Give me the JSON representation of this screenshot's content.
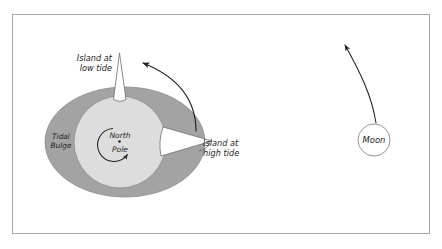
{
  "figure": {
    "frame": {
      "border_color": "#a8a8a8",
      "background_color": "#ffffff"
    }
  },
  "earth": {
    "bulge": {
      "label_line1": "Tidal",
      "label_line2": "Bulge",
      "fill_color": "#a3a3a3",
      "stroke_color": "#8a8a8a",
      "center_x": 125,
      "center_y": 142,
      "radius_x": 80,
      "radius_y": 55
    },
    "globe": {
      "fill_color": "#dddddd",
      "stroke_color": "#8a8a8a",
      "center_x": 120,
      "center_y": 142,
      "radius": 46
    },
    "pole": {
      "label_line1": "North",
      "label_line2": "Pole",
      "marker": "dot",
      "rotation_direction": "counterclockwise"
    }
  },
  "islands": [
    {
      "name": "low-tide-island",
      "label_line1": "Island at",
      "label_line2": "low tide",
      "fill_color": "#ffffff",
      "stroke_color": "#6f6f6f",
      "position": "top"
    },
    {
      "name": "high-tide-island",
      "label_line1": "Island at",
      "label_line2": "high tide",
      "fill_color": "#ffffff",
      "stroke_color": "#6f6f6f",
      "position": "right"
    }
  ],
  "moon": {
    "label": "Moon",
    "fill_color": "#ffffff",
    "stroke_color": "#8a8a8a",
    "center_x": 374,
    "center_y": 140,
    "radius": 16,
    "orbit_arrow": {
      "name": "moon-orbit-arrow",
      "direction": "up-left",
      "color": "#231f20"
    }
  },
  "earth_rotation_arrow": {
    "name": "earth-rotation-arrow",
    "direction": "counterclockwise",
    "color": "#231f20"
  }
}
